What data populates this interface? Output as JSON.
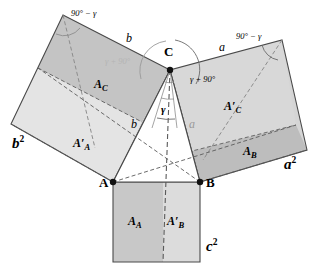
{
  "figure": {
    "vertices": [
      {
        "name": "A",
        "label": "A",
        "x": 113,
        "y": 182
      },
      {
        "name": "B",
        "label": "B",
        "x": 200,
        "y": 182
      },
      {
        "name": "C",
        "label": "C",
        "x": 170,
        "y": 70
      }
    ],
    "squares": [
      {
        "name": "square-on-b",
        "label": "b",
        "exponent": "2"
      },
      {
        "name": "square-on-a",
        "label": "a",
        "exponent": "2"
      },
      {
        "name": "square-on-c",
        "label": "c",
        "exponent": "2"
      }
    ],
    "area_labels": [
      {
        "name": "area-A-C",
        "base": "A",
        "sub": "C",
        "prime": false
      },
      {
        "name": "area-A-prime-C",
        "base": "A",
        "sub": "C",
        "prime": true
      },
      {
        "name": "area-A-prime-A",
        "base": "A",
        "sub": "A",
        "prime": true
      },
      {
        "name": "area-A-B",
        "base": "A",
        "sub": "B",
        "prime": false
      },
      {
        "name": "area-A-A",
        "base": "A",
        "sub": "A",
        "prime": false
      },
      {
        "name": "area-A-prime-B",
        "base": "A",
        "sub": "B",
        "prime": true
      }
    ],
    "side_labels": [
      {
        "name": "side-b-top",
        "text": "b"
      },
      {
        "name": "side-b-lower",
        "text": "b"
      },
      {
        "name": "side-a-top",
        "text": "a"
      },
      {
        "name": "side-a-lower",
        "text": "a"
      }
    ],
    "angle_labels": [
      {
        "name": "angle-90-minus-gamma-left",
        "text": "90° − γ"
      },
      {
        "name": "angle-90-minus-gamma-right",
        "text": "90° − γ"
      },
      {
        "name": "angle-gamma-plus-90-left",
        "text": "γ + 90°"
      },
      {
        "name": "angle-gamma-plus-90-right",
        "text": "γ + 90°"
      },
      {
        "name": "angle-gamma-apex",
        "text": "γ"
      }
    ],
    "text": {
      "vertex_A": "A",
      "vertex_B": "B",
      "vertex_C": "C",
      "b_squared_base": "b",
      "b_squared_exp": "2",
      "a_squared_base": "a",
      "a_squared_exp": "2",
      "c_squared_base": "c",
      "c_squared_exp": "2",
      "A_C": "A",
      "A_C_sub": "C",
      "A_prime_C": "A",
      "A_prime_C_sub": "C",
      "A_prime_A": "A",
      "A_prime_A_sub": "A",
      "A_B": "A",
      "A_B_sub": "B",
      "A_A": "A",
      "A_A_sub": "A",
      "A_prime_B": "A",
      "A_prime_B_sub": "B",
      "prime_mark": "′",
      "side_b_top": "b",
      "side_b_lower": "b",
      "side_a_top": "a",
      "side_a_lower": "a",
      "angle_90_minus_gamma_left": "90° − γ",
      "angle_90_minus_gamma_right": "90° − γ",
      "angle_gamma_plus_90_left": "γ + 90°",
      "angle_gamma_plus_90_right": "γ + 90°",
      "angle_gamma": "γ"
    },
    "colors": {
      "outline": "#4a4a4a",
      "fill_dark": "#c2c2c2",
      "fill_medium": "#cfcfcf",
      "fill_light": "#e2e2e2",
      "fill_lighter": "#dcdcdc",
      "fill_strip": "#c0c0c0",
      "triangle_fill": "#ffffff",
      "text": "#000000",
      "faded_text": "#b4b4b4"
    },
    "geometry": {
      "square_b": [
        [
          113,
          182
        ],
        [
          170,
          70
        ],
        [
          63,
          15
        ],
        [
          11,
          124
        ]
      ],
      "square_a": [
        [
          200,
          182
        ],
        [
          282,
          40
        ],
        [
          307,
          150
        ],
        [
          170,
          70
        ]
      ],
      "square_c": [
        [
          113,
          182
        ],
        [
          200,
          182
        ],
        [
          200,
          262
        ],
        [
          113,
          262
        ]
      ],
      "triangle": [
        [
          113,
          182
        ],
        [
          200,
          182
        ],
        [
          170,
          70
        ]
      ],
      "foot_of_altitude": [
        163,
        182
      ],
      "b_split_left": [
        11,
        124
      ],
      "b_split_right": [
        113,
        182
      ],
      "b_split_inner_left": [
        38,
        68
      ],
      "a_strip_top_left": [
        188,
        152
      ],
      "a_strip_top_right": [
        296,
        125
      ]
    }
  }
}
